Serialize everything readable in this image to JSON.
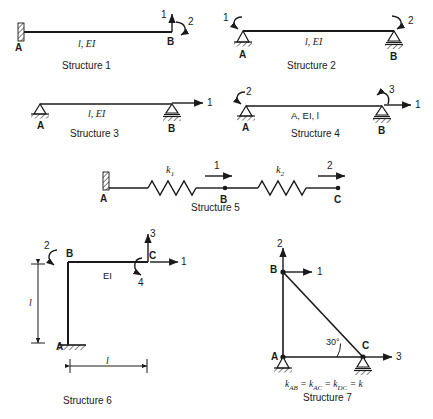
{
  "figure": {
    "title_domain": "structural-analysis-worksheet",
    "stroke_color": "#1a1a1a",
    "background": "#ffffff"
  },
  "structures": [
    {
      "id": "structure-1",
      "caption": "Structure 1",
      "type": "cantilever-beam",
      "member_label": "l, EI",
      "nodes": [
        {
          "name": "A",
          "label": "A",
          "support": "fixed-wall"
        },
        {
          "name": "B",
          "label": "B",
          "support": "free"
        }
      ],
      "dofs": [
        {
          "label": "1",
          "kind": "force",
          "direction": "up",
          "at": "B"
        },
        {
          "label": "2",
          "kind": "moment",
          "direction": "clockwise",
          "at": "B"
        }
      ]
    },
    {
      "id": "structure-2",
      "caption": "Structure 2",
      "type": "simply-supported-beam",
      "member_label": "l, EI",
      "nodes": [
        {
          "name": "A",
          "label": "A",
          "support": "pin"
        },
        {
          "name": "B",
          "label": "B",
          "support": "roller"
        }
      ],
      "dofs": [
        {
          "label": "1",
          "kind": "moment",
          "direction": "counterclockwise",
          "at": "A"
        },
        {
          "label": "2",
          "kind": "moment",
          "direction": "clockwise",
          "at": "B"
        }
      ]
    },
    {
      "id": "structure-3",
      "caption": "Structure 3",
      "type": "simply-supported-beam",
      "member_label": "l, EI",
      "nodes": [
        {
          "name": "A",
          "label": "A",
          "support": "pin"
        },
        {
          "name": "B",
          "label": "B",
          "support": "roller"
        }
      ],
      "dofs": [
        {
          "label": "1",
          "kind": "force",
          "direction": "right",
          "at": "B"
        }
      ]
    },
    {
      "id": "structure-4",
      "caption": "Structure 4",
      "type": "simply-supported-beam",
      "member_label": "A, EI, l",
      "nodes": [
        {
          "name": "A",
          "label": "A",
          "support": "pin"
        },
        {
          "name": "B",
          "label": "B",
          "support": "roller"
        }
      ],
      "dofs": [
        {
          "label": "2",
          "kind": "moment",
          "direction": "counterclockwise",
          "at": "A"
        },
        {
          "label": "3",
          "kind": "moment",
          "direction": "counterclockwise",
          "at": "B"
        },
        {
          "label": "1",
          "kind": "force",
          "direction": "right",
          "at": "B"
        }
      ]
    },
    {
      "id": "structure-5",
      "caption": "Structure 5",
      "type": "spring-chain",
      "springs": [
        {
          "label": "k",
          "subscript": "1",
          "between": "A-B"
        },
        {
          "label": "k",
          "subscript": "2",
          "between": "B-C"
        }
      ],
      "nodes": [
        {
          "name": "A",
          "label": "A",
          "support": "fixed-wall"
        },
        {
          "name": "B",
          "label": "B",
          "support": "free-node"
        },
        {
          "name": "C",
          "label": "C",
          "support": "free-node"
        }
      ],
      "dofs": [
        {
          "label": "1",
          "kind": "force",
          "direction": "right",
          "at": "B"
        },
        {
          "label": "2",
          "kind": "force",
          "direction": "right",
          "at": "C"
        }
      ]
    },
    {
      "id": "structure-6",
      "caption": "Structure 6",
      "type": "l-frame",
      "member_label": "EI",
      "dimensions": [
        {
          "label": "l",
          "orientation": "vertical"
        },
        {
          "label": "l",
          "orientation": "horizontal"
        }
      ],
      "nodes": [
        {
          "name": "A",
          "label": "A",
          "support": "fixed-base"
        },
        {
          "name": "B",
          "label": "B",
          "support": "rigid-corner"
        },
        {
          "name": "C",
          "label": "C",
          "support": "free"
        }
      ],
      "dofs": [
        {
          "label": "2",
          "kind": "moment",
          "direction": "clockwise",
          "at": "B"
        },
        {
          "label": "3",
          "kind": "force",
          "direction": "up",
          "at": "C"
        },
        {
          "label": "1",
          "kind": "force",
          "direction": "right",
          "at": "C"
        },
        {
          "label": "4",
          "kind": "moment",
          "direction": "clockwise",
          "at": "C"
        }
      ]
    },
    {
      "id": "structure-7",
      "caption": "Structure 7",
      "type": "truss",
      "angle_label": "30°",
      "stiffness_note": "k_AB = k_AC = k_DC = k",
      "stiffness_parts": {
        "k1": "k",
        "s1": "AB",
        "k2": "k",
        "s2": "AC",
        "k3": "k",
        "s3": "DC",
        "rhs": "k"
      },
      "nodes": [
        {
          "name": "A",
          "label": "A",
          "support": "pin"
        },
        {
          "name": "B",
          "label": "B",
          "support": "free"
        },
        {
          "name": "C",
          "label": "C",
          "support": "roller"
        }
      ],
      "dofs": [
        {
          "label": "2",
          "kind": "force",
          "direction": "up",
          "at": "B"
        },
        {
          "label": "1",
          "kind": "force",
          "direction": "right",
          "at": "B"
        },
        {
          "label": "3",
          "kind": "force",
          "direction": "right",
          "at": "C"
        }
      ]
    }
  ]
}
